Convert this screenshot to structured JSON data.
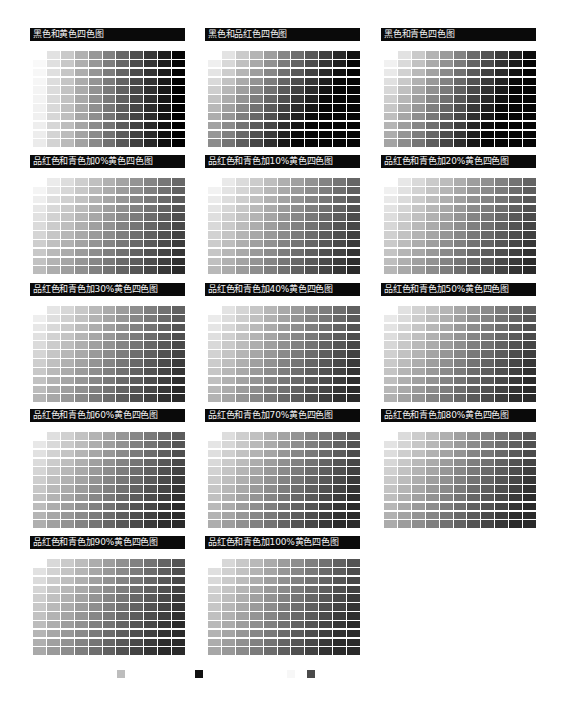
{
  "panels": [
    {
      "title": "黑色和黄色四色图",
      "mode": "k_y",
      "pct": null
    },
    {
      "title": "黑色和品红色四色图",
      "mode": "k_m",
      "pct": null
    },
    {
      "title": "黑色和青色四色图",
      "mode": "k_c",
      "pct": null
    },
    {
      "title": "品红色和青色加0%黄色四色图",
      "mode": "mc",
      "pct": 0
    },
    {
      "title": "品红色和青色加10%黄色四色图",
      "mode": "mc",
      "pct": 10
    },
    {
      "title": "品红色和青色加20%黄色四色图",
      "mode": "mc",
      "pct": 20
    },
    {
      "title": "品红色和青色加30%黄色四色图",
      "mode": "mc",
      "pct": 30
    },
    {
      "title": "品红色和青色加40%黄色四色图",
      "mode": "mc",
      "pct": 40
    },
    {
      "title": "品红色和青色加50%黄色四色图",
      "mode": "mc",
      "pct": 50
    },
    {
      "title": "品红色和青色加60%黄色四色图",
      "mode": "mc",
      "pct": 60
    },
    {
      "title": "品红色和青色加70%黄色四色图",
      "mode": "mc",
      "pct": 70
    },
    {
      "title": "品红色和青色加80%黄色四色图",
      "mode": "mc",
      "pct": 80
    },
    {
      "title": "品红色和青色加90%黄色四色图",
      "mode": "mc",
      "pct": 90
    },
    {
      "title": "品红色和青色加100%黄色四色图",
      "mode": "mc",
      "pct": 100
    }
  ],
  "grid": {
    "rows": 11,
    "cols": 11
  },
  "legend": [
    {
      "x": 117,
      "color": "#bdbdbd"
    },
    {
      "x": 195,
      "color": "#111111"
    },
    {
      "x": 287,
      "color": "#f7f7f7"
    },
    {
      "x": 307,
      "color": "#4a4a4a"
    }
  ]
}
